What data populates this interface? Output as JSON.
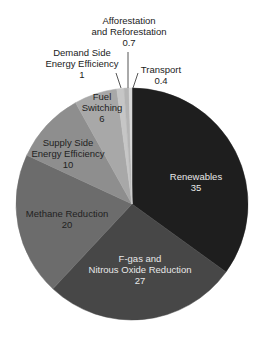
{
  "chart_data": {
    "type": "pie",
    "title": "",
    "unit": "",
    "start_angle_deg": 0,
    "direction": "clockwise",
    "slices": [
      {
        "label": "Renewables",
        "value": 35,
        "color": "#1e1e1e"
      },
      {
        "label": "F-gas and Nitrous Oxide Reduction",
        "value": 27,
        "color": "#474747"
      },
      {
        "label": "Methane Reduction",
        "value": 20,
        "color": "#6c6c6c"
      },
      {
        "label": "Supply Side Energy Efficiency",
        "value": 10,
        "color": "#8e8e8e"
      },
      {
        "label": "Fuel Switching",
        "value": 6,
        "color": "#a8a8a8"
      },
      {
        "label": "Demand Side Energy Efficiency",
        "value": 1,
        "color": "#c6c6c6"
      },
      {
        "label": "Afforestation and Reforestation",
        "value": 0.7,
        "color": "#b4b4b4"
      },
      {
        "label": "Transport",
        "value": 0.4,
        "color": "#d8d8d8"
      }
    ],
    "legend": "none (direct labels)"
  },
  "labels": {
    "renewables": {
      "name": "Renewables",
      "value": "35"
    },
    "fgas": {
      "line1": "F-gas and",
      "line2": "Nitrous Oxide Reduction",
      "value": "27"
    },
    "methane": {
      "name": "Methane Reduction",
      "value": "20"
    },
    "supply": {
      "line1": "Supply Side",
      "line2": "Energy Efficiency",
      "value": "10"
    },
    "fuel": {
      "line1": "Fuel",
      "line2": "Switching",
      "value": "6"
    },
    "demand": {
      "line1": "Demand Side",
      "line2": "Energy Efficiency",
      "value": "1"
    },
    "afforestation": {
      "line1": "Afforestation",
      "line2": "and Reforestation",
      "value": "0.7"
    },
    "transport": {
      "name": "Transport",
      "value": "0.4"
    }
  }
}
